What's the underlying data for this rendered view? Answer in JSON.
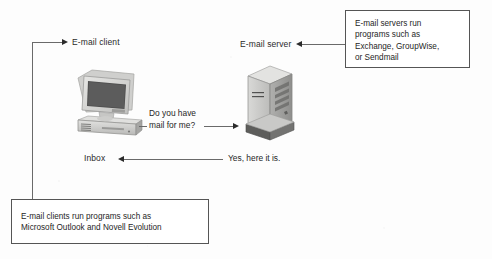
{
  "diagram": {
    "labels": {
      "client": "E-mail client",
      "server": "E-mail server",
      "inbox": "Inbox",
      "request": "Do you have\nmail for me?",
      "response": "Yes, here it is."
    },
    "callouts": {
      "server_note": "E-mail servers run\nprograms such as\nExchange, GroupWise,\nor Sendmail",
      "client_note": "E-mail clients run programs such as\nMicrosoft Outlook and Novell Evolution"
    },
    "icons": {
      "computer": "desktop-computer-icon",
      "server": "tower-server-icon"
    },
    "colors": {
      "line": "#6a6a6a",
      "arrow": "#2b2b2b",
      "box_border": "#555555",
      "text": "#262626",
      "page_background": "#fdfdfd",
      "hardware_light": "#d6d6d4",
      "hardware_mid": "#b4b4b2",
      "hardware_dark": "#8d8d8b",
      "screen": "#4a4a4a"
    }
  }
}
